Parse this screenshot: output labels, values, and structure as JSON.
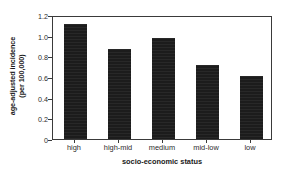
{
  "chart_data": {
    "type": "bar",
    "title": "",
    "categories": [
      "high",
      "high-mid",
      "medium",
      "mid-low",
      "low"
    ],
    "values": [
      1.11,
      0.87,
      0.98,
      0.72,
      0.61
    ],
    "xlabel": "socio-economic status",
    "ylabel_line1": "age-adjusted incidence",
    "ylabel_line2": "(per 100,000)",
    "ylabel": "age-adjusted incidence (per 100,000)",
    "ylim": [
      0,
      1.2
    ],
    "yticks": [
      "0",
      "0.2",
      "0.4",
      "0.6",
      "0.8",
      "1.0",
      "1.2"
    ],
    "ytick_values": [
      0,
      0.2,
      0.4,
      0.6,
      0.8,
      1.0,
      1.2
    ],
    "grid": false,
    "legend": null,
    "bar_color": "#1c1c1c",
    "axis_color": "#3a3a3a",
    "background": "#ffffff"
  }
}
